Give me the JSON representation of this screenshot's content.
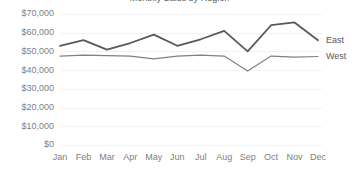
{
  "chart_data": {
    "type": "line",
    "title": "Monthly Sales by Region",
    "title_clipped": true,
    "xlabel": "",
    "ylabel": "",
    "categories": [
      "Jan",
      "Feb",
      "Mar",
      "Apr",
      "May",
      "Jun",
      "Jul",
      "Aug",
      "Sep",
      "Oct",
      "Nov",
      "Dec"
    ],
    "ytick_labels": [
      "$70,000",
      "$60,000",
      "$50,000",
      "$40,000",
      "$30,000",
      "$20,000",
      "$10,000",
      "$0"
    ],
    "ytick_values": [
      70000,
      60000,
      50000,
      40000,
      30000,
      20000,
      10000,
      0
    ],
    "ylim": [
      0,
      70000
    ],
    "grid": true,
    "grid_axis": "y",
    "legend": "inline-right",
    "series": [
      {
        "name": "East",
        "color": "#595959",
        "width": 1.8,
        "values": [
          53000,
          56000,
          51000,
          54500,
          59000,
          53000,
          56500,
          61000,
          50000,
          64000,
          65500,
          56000
        ]
      },
      {
        "name": "West",
        "color": "#808080",
        "width": 1.2,
        "values": [
          47500,
          48000,
          47800,
          47500,
          46000,
          47500,
          48000,
          47500,
          39500,
          47500,
          47000,
          47300
        ]
      }
    ]
  },
  "colors": {
    "background": "#ffffff",
    "gridline": "#f2f2f2",
    "tick_text": "#808080",
    "series_label_text": "#595959"
  }
}
